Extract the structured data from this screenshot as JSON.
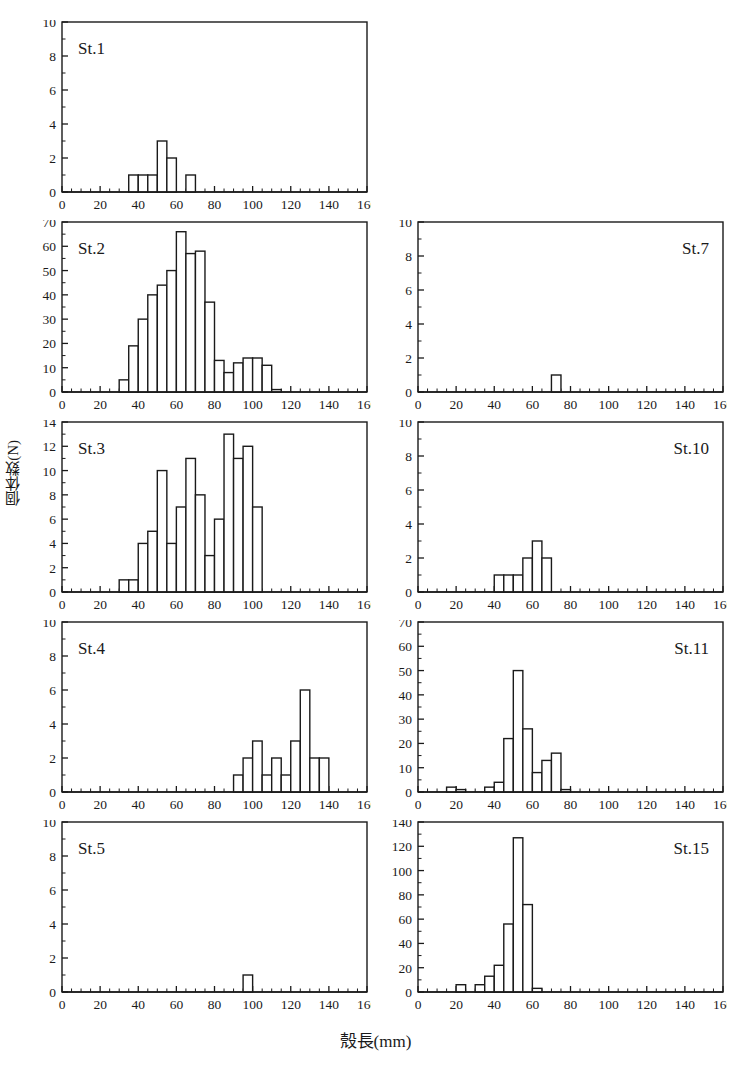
{
  "figure": {
    "axis_labels": {
      "x": "殼長(mm)",
      "y": "個体数(N)"
    },
    "x_ticks": [
      "0",
      "20",
      "40",
      "60",
      "80",
      "100",
      "120",
      "140",
      "160"
    ],
    "bin_width": 5,
    "xlim": [
      0,
      160
    ],
    "stroke_color": "#1a1a1a",
    "fill_color": "#ffffff"
  },
  "chart_data": [
    {
      "type": "bar",
      "title": "St.1",
      "xlabel": "殼長(mm)",
      "ylabel": "個体数(N)",
      "xlim": [
        0,
        160
      ],
      "ylim": [
        0,
        10
      ],
      "y_ticks": [
        0,
        2,
        4,
        6,
        8,
        10
      ],
      "x_ticks": [
        0,
        20,
        40,
        60,
        80,
        100,
        120,
        140,
        160
      ],
      "grid": false,
      "legend": "none",
      "bin_width": 5,
      "bins": [
        35,
        40,
        45,
        50,
        55,
        60,
        65
      ],
      "categories": [
        "35-40",
        "40-45",
        "45-50",
        "50-55",
        "55-60",
        "60-65",
        "65-70"
      ],
      "values": [
        1,
        1,
        1,
        3,
        2,
        0,
        1
      ]
    },
    {
      "type": "bar",
      "title": "St.2",
      "xlabel": "殼長(mm)",
      "ylabel": "個体数(N)",
      "xlim": [
        0,
        160
      ],
      "ylim": [
        0,
        70
      ],
      "y_ticks": [
        0,
        10,
        20,
        30,
        40,
        50,
        60,
        70
      ],
      "x_ticks": [
        0,
        20,
        40,
        60,
        80,
        100,
        120,
        140,
        160
      ],
      "grid": false,
      "legend": "none",
      "bin_width": 5,
      "bins": [
        30,
        35,
        40,
        45,
        50,
        55,
        60,
        65,
        70,
        75,
        80,
        85,
        90,
        95,
        100,
        105,
        110
      ],
      "categories": [
        "30-35",
        "35-40",
        "40-45",
        "45-50",
        "50-55",
        "55-60",
        "60-65",
        "65-70",
        "70-75",
        "75-80",
        "80-85",
        "85-90",
        "90-95",
        "95-100",
        "100-105",
        "105-110",
        "110-115"
      ],
      "values": [
        5,
        19,
        30,
        40,
        44,
        50,
        66,
        57,
        58,
        37,
        13,
        8,
        12,
        14,
        14,
        11,
        1
      ]
    },
    {
      "type": "bar",
      "title": "St.3",
      "xlabel": "殼長(mm)",
      "ylabel": "個体数(N)",
      "xlim": [
        0,
        160
      ],
      "ylim": [
        0,
        14
      ],
      "y_ticks": [
        0,
        2,
        4,
        6,
        8,
        10,
        12,
        14
      ],
      "x_ticks": [
        0,
        20,
        40,
        60,
        80,
        100,
        120,
        140,
        160
      ],
      "grid": false,
      "legend": "none",
      "bin_width": 5,
      "bins": [
        30,
        35,
        40,
        45,
        50,
        55,
        60,
        65,
        70,
        75,
        80,
        85,
        90,
        95,
        100
      ],
      "categories": [
        "30-35",
        "35-40",
        "40-45",
        "45-50",
        "50-55",
        "55-60",
        "60-65",
        "65-70",
        "70-75",
        "75-80",
        "80-85",
        "85-90",
        "90-95",
        "95-100",
        "100-105"
      ],
      "values": [
        1,
        1,
        4,
        5,
        10,
        4,
        7,
        11,
        8,
        3,
        6,
        13,
        11,
        12,
        7
      ]
    },
    {
      "type": "bar",
      "title": "St.4",
      "xlabel": "殼長(mm)",
      "ylabel": "個体数(N)",
      "xlim": [
        0,
        160
      ],
      "ylim": [
        0,
        10
      ],
      "y_ticks": [
        0,
        2,
        4,
        6,
        8,
        10
      ],
      "x_ticks": [
        0,
        20,
        40,
        60,
        80,
        100,
        120,
        140,
        160
      ],
      "grid": false,
      "legend": "none",
      "bin_width": 5,
      "bins": [
        90,
        95,
        100,
        105,
        110,
        115,
        120,
        125,
        130,
        135
      ],
      "categories": [
        "90-95",
        "95-100",
        "100-105",
        "105-110",
        "110-115",
        "115-120",
        "120-125",
        "125-130",
        "130-135",
        "135-140"
      ],
      "values": [
        1,
        2,
        3,
        1,
        2,
        1,
        3,
        6,
        2,
        2
      ]
    },
    {
      "type": "bar",
      "title": "St.5",
      "xlabel": "殼長(mm)",
      "ylabel": "個体数(N)",
      "xlim": [
        0,
        160
      ],
      "ylim": [
        0,
        10
      ],
      "y_ticks": [
        0,
        2,
        4,
        6,
        8,
        10
      ],
      "x_ticks": [
        0,
        20,
        40,
        60,
        80,
        100,
        120,
        140,
        160
      ],
      "grid": false,
      "legend": "none",
      "bin_width": 5,
      "bins": [
        95
      ],
      "categories": [
        "95-100"
      ],
      "values": [
        1
      ]
    },
    {
      "type": "bar",
      "title": "St.7",
      "xlabel": "殼長(mm)",
      "ylabel": "個体数(N)",
      "xlim": [
        0,
        160
      ],
      "ylim": [
        0,
        10
      ],
      "y_ticks": [
        0,
        2,
        4,
        6,
        8,
        10
      ],
      "x_ticks": [
        0,
        20,
        40,
        60,
        80,
        100,
        120,
        140,
        160
      ],
      "grid": false,
      "legend": "none",
      "bin_width": 5,
      "bins": [
        70
      ],
      "categories": [
        "70-75"
      ],
      "values": [
        1
      ]
    },
    {
      "type": "bar",
      "title": "St.10",
      "xlabel": "殼長(mm)",
      "ylabel": "個体数(N)",
      "xlim": [
        0,
        160
      ],
      "ylim": [
        0,
        10
      ],
      "y_ticks": [
        0,
        2,
        4,
        6,
        8,
        10
      ],
      "x_ticks": [
        0,
        20,
        40,
        60,
        80,
        100,
        120,
        140,
        160
      ],
      "grid": false,
      "legend": "none",
      "bin_width": 5,
      "bins": [
        40,
        45,
        50,
        55,
        60,
        65
      ],
      "categories": [
        "40-45",
        "45-50",
        "50-55",
        "55-60",
        "60-65",
        "65-70"
      ],
      "values": [
        1,
        1,
        1,
        2,
        3,
        2
      ]
    },
    {
      "type": "bar",
      "title": "St.11",
      "xlabel": "殼長(mm)",
      "ylabel": "個体数(N)",
      "xlim": [
        0,
        160
      ],
      "ylim": [
        0,
        70
      ],
      "y_ticks": [
        0,
        10,
        20,
        30,
        40,
        50,
        60,
        70
      ],
      "x_ticks": [
        0,
        20,
        40,
        60,
        80,
        100,
        120,
        140,
        160
      ],
      "grid": false,
      "legend": "none",
      "bin_width": 5,
      "bins": [
        15,
        20,
        35,
        40,
        45,
        50,
        55,
        60,
        65,
        70,
        75
      ],
      "categories": [
        "15-20",
        "20-25",
        "35-40",
        "40-45",
        "45-50",
        "50-55",
        "55-60",
        "60-65",
        "65-70",
        "70-75",
        "75-80"
      ],
      "values": [
        2,
        1,
        2,
        4,
        22,
        50,
        26,
        8,
        13,
        16,
        1
      ]
    },
    {
      "type": "bar",
      "title": "St.15",
      "xlabel": "殼長(mm)",
      "ylabel": "個体数(N)",
      "xlim": [
        0,
        160
      ],
      "ylim": [
        0,
        140
      ],
      "y_ticks": [
        0,
        20,
        40,
        60,
        80,
        100,
        120,
        140
      ],
      "x_ticks": [
        0,
        20,
        40,
        60,
        80,
        100,
        120,
        140,
        160
      ],
      "grid": false,
      "legend": "none",
      "bin_width": 5,
      "bins": [
        20,
        30,
        35,
        40,
        45,
        50,
        55,
        60
      ],
      "categories": [
        "20-25",
        "30-35",
        "35-40",
        "40-45",
        "45-50",
        "50-55",
        "55-60",
        "60-65"
      ],
      "values": [
        6,
        6,
        13,
        22,
        56,
        127,
        72,
        3
      ]
    }
  ],
  "panels": [
    {
      "id": "st1",
      "chart_index": 0,
      "left": 62,
      "top": 22,
      "width": 305,
      "height": 170,
      "title_align": "left"
    },
    {
      "id": "st2",
      "chart_index": 1,
      "left": 62,
      "top": 222,
      "width": 305,
      "height": 170,
      "title_align": "left"
    },
    {
      "id": "st3",
      "chart_index": 2,
      "left": 62,
      "top": 422,
      "width": 305,
      "height": 170,
      "title_align": "left"
    },
    {
      "id": "st4",
      "chart_index": 3,
      "left": 62,
      "top": 622,
      "width": 305,
      "height": 170,
      "title_align": "left"
    },
    {
      "id": "st5",
      "chart_index": 4,
      "left": 62,
      "top": 822,
      "width": 305,
      "height": 170,
      "title_align": "left"
    },
    {
      "id": "st7",
      "chart_index": 5,
      "left": 418,
      "top": 222,
      "width": 305,
      "height": 170,
      "title_align": "right"
    },
    {
      "id": "st10",
      "chart_index": 6,
      "left": 418,
      "top": 422,
      "width": 305,
      "height": 170,
      "title_align": "right"
    },
    {
      "id": "st11",
      "chart_index": 7,
      "left": 418,
      "top": 622,
      "width": 305,
      "height": 170,
      "title_align": "right"
    },
    {
      "id": "st15",
      "chart_index": 8,
      "left": 418,
      "top": 822,
      "width": 305,
      "height": 170,
      "title_align": "right"
    }
  ]
}
